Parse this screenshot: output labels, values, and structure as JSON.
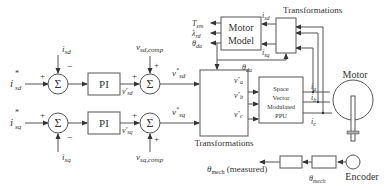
{
  "diagram": {
    "inputs": {
      "isd_ref": "i*sd",
      "isq_ref": "i*sq",
      "isd_fb": "isd",
      "isq_fb": "isq"
    },
    "blocks": {
      "sum_d1": "Σ",
      "sum_q1": "Σ",
      "pi_d": "PI",
      "pi_q": "PI",
      "sum_d2": "Σ",
      "sum_q2": "Σ",
      "transformations_left": "Transformations",
      "svm": [
        "Space",
        "Vector",
        "Modulated",
        "PPU"
      ],
      "motor_model": [
        "Motor",
        "Model"
      ],
      "transformations_top": "Transformations",
      "motor": "Motor",
      "encoder": "Encoder"
    },
    "signals": {
      "vsd_prime": "v'sd",
      "vsq_prime": "v'sq",
      "vsd_comp": "vsd,comp",
      "vsq_comp": "vsq,comp",
      "vsd_ref": "v*sd",
      "vsq_ref": "v*sq",
      "va_ref": "v*a",
      "vb_ref": "v*b",
      "vc_ref": "v*c",
      "ia": "ia",
      "ib": "ib",
      "ic": "ic",
      "isd_out": "isd",
      "isq_out": "isq",
      "tem": "Tem",
      "lambda_rd": "λrd",
      "theta_da_out": "θda",
      "theta_da": "θda",
      "theta_mech": "θmech",
      "theta_mech_measured": "θmech (measured)"
    },
    "signs": {
      "plus": "+",
      "minus": "−"
    }
  }
}
